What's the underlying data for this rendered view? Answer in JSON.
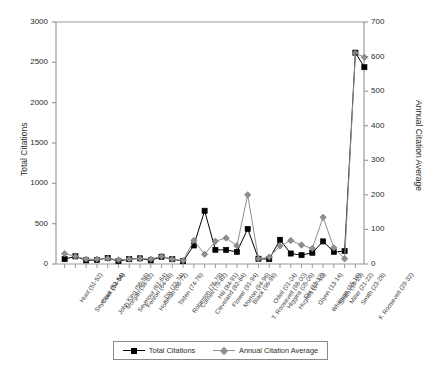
{
  "chart_data": {
    "type": "line",
    "title": "",
    "xlabel": "",
    "ylabel": "Total Citations",
    "y2label": "Annual Citation Average",
    "ylim": [
      0,
      3000
    ],
    "y2lim": [
      0,
      700
    ],
    "yticks": [
      0,
      500,
      1000,
      1500,
      2000,
      2500,
      3000
    ],
    "y2ticks": [
      0,
      100,
      200,
      300,
      400,
      500,
      600,
      700
    ],
    "grid": false,
    "legend_position": "bottom",
    "categories": [
      "Hunt (51-52)",
      "Seymour (52-54)",
      "Clark (54-56)",
      "John King (56-58)",
      "Morgan (58-62)",
      "Seymour (61-64)",
      "Fenton (64-68)",
      "Hoffman (68-72)",
      "Dix (72-74)",
      "Tilden (74-76)",
      "Robinson (76-79)",
      "Cornell (79-82)",
      "Cleveland (82-84)",
      "Hill (84-91)",
      "Flower (91-94)",
      "Morton (94-96)",
      "Black (96-98)",
      "T. Roosevelt (98-00)",
      "Odell (01-04)",
      "Higgins (05-06)",
      "Hughes (07-10)",
      "Dix (11-12)",
      "Glynn (13-14)",
      "Whitman (15-16)",
      "Smith (19-20)",
      "Miller (21-22)",
      "Smith (23-28)",
      "F. Roosevelt (29-32)"
    ],
    "series": [
      {
        "name": "Total Citations",
        "axis": "left",
        "marker": "square",
        "color": "#000000",
        "values": [
          60,
          95,
          45,
          50,
          75,
          35,
          60,
          70,
          45,
          90,
          60,
          35,
          230,
          660,
          175,
          175,
          150,
          435,
          65,
          60,
          300,
          130,
          110,
          140,
          280,
          150,
          160,
          2620
        ]
      },
      {
        "name": "Annual Citation Average",
        "axis": "right",
        "marker": "diamond",
        "color": "#8f8f8f",
        "values": [
          30,
          22,
          14,
          14,
          16,
          12,
          14,
          16,
          14,
          22,
          14,
          10,
          68,
          28,
          66,
          75,
          53,
          200,
          15,
          20,
          52,
          68,
          55,
          45,
          135,
          47,
          15,
          610
        ]
      }
    ],
    "final_point_extra": {
      "note": "last category shows a second lower square at 2440"
    }
  },
  "legend": {
    "items": [
      {
        "label": "Total Citations",
        "marker": "square"
      },
      {
        "label": "Annual Citation Average",
        "marker": "diamond"
      }
    ]
  },
  "colors": {
    "series1": "#000000",
    "series2": "#8f8f8f",
    "axis": "#9a9a9a",
    "text": "#2b2b2b"
  }
}
